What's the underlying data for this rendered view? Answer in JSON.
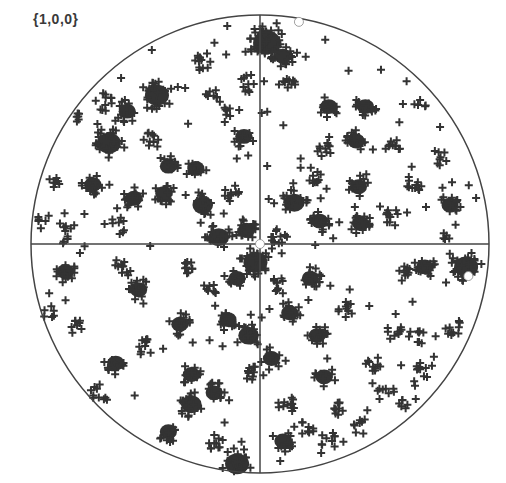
{
  "chart_data": {
    "type": "scatter",
    "title": "{1,0,0}",
    "subtype": "pole figure (stereographic projection)",
    "xlabel": "",
    "ylabel": "",
    "grid": false,
    "legend": null,
    "axes": {
      "center": [
        260,
        244
      ],
      "radius": 229,
      "crosshair": true
    },
    "colors": {
      "points": "#333333",
      "circle": "#444444",
      "background": "#ffffff",
      "marker_highlight": "#ffffff"
    },
    "marker": "+",
    "note": "Positions in normalized projection coordinates (-1..1, y up). Clusters are approximate densities read off the figure.",
    "highlight_points": [
      {
        "x": 0.17,
        "y": 0.97
      },
      {
        "x": 0.0,
        "y": 0.0
      },
      {
        "x": 0.91,
        "y": -0.14
      }
    ],
    "clusters": [
      {
        "x": 0.03,
        "y": 0.88,
        "r": 0.08,
        "n": 40
      },
      {
        "x": 0.1,
        "y": 0.82,
        "r": 0.05,
        "n": 14
      },
      {
        "x": -0.05,
        "y": 0.7,
        "r": 0.04,
        "n": 10
      },
      {
        "x": -0.25,
        "y": 0.79,
        "r": 0.04,
        "n": 10
      },
      {
        "x": -0.2,
        "y": 0.65,
        "r": 0.04,
        "n": 8
      },
      {
        "x": -0.45,
        "y": 0.65,
        "r": 0.07,
        "n": 24
      },
      {
        "x": -0.58,
        "y": 0.58,
        "r": 0.05,
        "n": 12
      },
      {
        "x": -0.68,
        "y": 0.62,
        "r": 0.04,
        "n": 10
      },
      {
        "x": -0.66,
        "y": 0.44,
        "r": 0.07,
        "n": 24
      },
      {
        "x": -0.48,
        "y": 0.45,
        "r": 0.04,
        "n": 10
      },
      {
        "x": -0.4,
        "y": 0.34,
        "r": 0.05,
        "n": 12
      },
      {
        "x": -0.28,
        "y": 0.33,
        "r": 0.05,
        "n": 12
      },
      {
        "x": -0.73,
        "y": 0.26,
        "r": 0.05,
        "n": 14
      },
      {
        "x": -0.55,
        "y": 0.2,
        "r": 0.05,
        "n": 12
      },
      {
        "x": -0.42,
        "y": 0.22,
        "r": 0.05,
        "n": 12
      },
      {
        "x": -0.25,
        "y": 0.17,
        "r": 0.06,
        "n": 14
      },
      {
        "x": -0.12,
        "y": 0.22,
        "r": 0.04,
        "n": 10
      },
      {
        "x": -0.07,
        "y": 0.47,
        "r": 0.05,
        "n": 12
      },
      {
        "x": -0.14,
        "y": 0.58,
        "r": 0.03,
        "n": 6
      },
      {
        "x": -0.62,
        "y": 0.08,
        "r": 0.04,
        "n": 8
      },
      {
        "x": -0.85,
        "y": 0.05,
        "r": 0.05,
        "n": 10
      },
      {
        "x": -0.18,
        "y": 0.03,
        "r": 0.06,
        "n": 16
      },
      {
        "x": -0.06,
        "y": 0.06,
        "r": 0.05,
        "n": 14
      },
      {
        "x": -0.02,
        "y": -0.08,
        "r": 0.07,
        "n": 24
      },
      {
        "x": 0.12,
        "y": 0.69,
        "r": 0.04,
        "n": 10
      },
      {
        "x": 0.3,
        "y": 0.6,
        "r": 0.05,
        "n": 12
      },
      {
        "x": 0.46,
        "y": 0.6,
        "r": 0.05,
        "n": 14
      },
      {
        "x": 0.42,
        "y": 0.45,
        "r": 0.05,
        "n": 14
      },
      {
        "x": 0.58,
        "y": 0.43,
        "r": 0.04,
        "n": 10
      },
      {
        "x": 0.28,
        "y": 0.42,
        "r": 0.04,
        "n": 10
      },
      {
        "x": 0.24,
        "y": 0.3,
        "r": 0.04,
        "n": 10
      },
      {
        "x": 0.43,
        "y": 0.25,
        "r": 0.05,
        "n": 12
      },
      {
        "x": 0.67,
        "y": 0.26,
        "r": 0.04,
        "n": 10
      },
      {
        "x": 0.78,
        "y": 0.38,
        "r": 0.04,
        "n": 8
      },
      {
        "x": 0.15,
        "y": 0.18,
        "r": 0.06,
        "n": 18
      },
      {
        "x": 0.26,
        "y": 0.1,
        "r": 0.05,
        "n": 14
      },
      {
        "x": 0.44,
        "y": 0.09,
        "r": 0.05,
        "n": 14
      },
      {
        "x": 0.58,
        "y": 0.12,
        "r": 0.04,
        "n": 10
      },
      {
        "x": 0.83,
        "y": 0.17,
        "r": 0.05,
        "n": 12
      },
      {
        "x": 0.08,
        "y": 0.04,
        "r": 0.04,
        "n": 10
      },
      {
        "x": 0.9,
        "y": -0.1,
        "r": 0.07,
        "n": 26
      },
      {
        "x": 0.72,
        "y": -0.1,
        "r": 0.05,
        "n": 14
      },
      {
        "x": 0.62,
        "y": -0.12,
        "r": 0.04,
        "n": 10
      },
      {
        "x": -0.85,
        "y": -0.12,
        "r": 0.05,
        "n": 14
      },
      {
        "x": -0.6,
        "y": -0.1,
        "r": 0.04,
        "n": 10
      },
      {
        "x": -0.53,
        "y": -0.2,
        "r": 0.05,
        "n": 12
      },
      {
        "x": -0.33,
        "y": -0.1,
        "r": 0.04,
        "n": 10
      },
      {
        "x": -0.23,
        "y": -0.2,
        "r": 0.04,
        "n": 8
      },
      {
        "x": -0.1,
        "y": -0.15,
        "r": 0.05,
        "n": 12
      },
      {
        "x": -0.35,
        "y": -0.35,
        "r": 0.05,
        "n": 14
      },
      {
        "x": -0.14,
        "y": -0.33,
        "r": 0.05,
        "n": 12
      },
      {
        "x": -0.05,
        "y": -0.4,
        "r": 0.06,
        "n": 18
      },
      {
        "x": -0.8,
        "y": -0.36,
        "r": 0.03,
        "n": 6
      },
      {
        "x": -0.5,
        "y": -0.45,
        "r": 0.04,
        "n": 10
      },
      {
        "x": -0.3,
        "y": -0.57,
        "r": 0.05,
        "n": 12
      },
      {
        "x": -0.2,
        "y": -0.65,
        "r": 0.05,
        "n": 12
      },
      {
        "x": -0.3,
        "y": -0.7,
        "r": 0.06,
        "n": 14
      },
      {
        "x": -0.03,
        "y": -0.56,
        "r": 0.04,
        "n": 10
      },
      {
        "x": -0.4,
        "y": -0.82,
        "r": 0.05,
        "n": 12
      },
      {
        "x": -0.2,
        "y": -0.86,
        "r": 0.04,
        "n": 10
      },
      {
        "x": -0.1,
        "y": -0.96,
        "r": 0.07,
        "n": 24
      },
      {
        "x": 0.08,
        "y": -0.18,
        "r": 0.04,
        "n": 10
      },
      {
        "x": 0.22,
        "y": -0.15,
        "r": 0.05,
        "n": 14
      },
      {
        "x": 0.38,
        "y": -0.28,
        "r": 0.04,
        "n": 10
      },
      {
        "x": 0.13,
        "y": -0.3,
        "r": 0.05,
        "n": 12
      },
      {
        "x": 0.25,
        "y": -0.4,
        "r": 0.05,
        "n": 12
      },
      {
        "x": 0.05,
        "y": -0.5,
        "r": 0.05,
        "n": 12
      },
      {
        "x": 0.28,
        "y": -0.58,
        "r": 0.05,
        "n": 12
      },
      {
        "x": 0.5,
        "y": -0.52,
        "r": 0.04,
        "n": 10
      },
      {
        "x": 0.58,
        "y": -0.38,
        "r": 0.04,
        "n": 8
      },
      {
        "x": 0.55,
        "y": -0.65,
        "r": 0.04,
        "n": 8
      },
      {
        "x": 0.72,
        "y": -0.55,
        "r": 0.04,
        "n": 10
      },
      {
        "x": 0.68,
        "y": -0.41,
        "r": 0.04,
        "n": 8
      },
      {
        "x": 0.84,
        "y": -0.36,
        "r": 0.04,
        "n": 10
      },
      {
        "x": 0.88,
        "y": -0.55,
        "r": 0.03,
        "n": 6
      },
      {
        "x": 0.35,
        "y": -0.72,
        "r": 0.04,
        "n": 10
      },
      {
        "x": 0.12,
        "y": -0.7,
        "r": 0.04,
        "n": 10
      },
      {
        "x": 0.1,
        "y": -0.86,
        "r": 0.05,
        "n": 12
      },
      {
        "x": 0.2,
        "y": -0.8,
        "r": 0.04,
        "n": 8
      },
      {
        "x": 0.3,
        "y": -0.86,
        "r": 0.04,
        "n": 8
      },
      {
        "x": 0.44,
        "y": -0.8,
        "r": 0.04,
        "n": 8
      },
      {
        "x": 0.62,
        "y": -0.7,
        "r": 0.03,
        "n": 6
      },
      {
        "x": -0.9,
        "y": 0.28,
        "r": 0.04,
        "n": 6
      },
      {
        "x": -0.8,
        "y": 0.55,
        "r": 0.03,
        "n": 6
      },
      {
        "x": -0.95,
        "y": 0.12,
        "r": 0.03,
        "n": 5
      },
      {
        "x": 0.7,
        "y": 0.62,
        "r": 0.03,
        "n": 5
      },
      {
        "x": 0.8,
        "y": 0.02,
        "r": 0.03,
        "n": 5
      },
      {
        "x": -0.7,
        "y": -0.65,
        "r": 0.04,
        "n": 8
      },
      {
        "x": -0.63,
        "y": -0.52,
        "r": 0.05,
        "n": 12
      },
      {
        "x": -0.92,
        "y": -0.3,
        "r": 0.03,
        "n": 5
      }
    ]
  }
}
